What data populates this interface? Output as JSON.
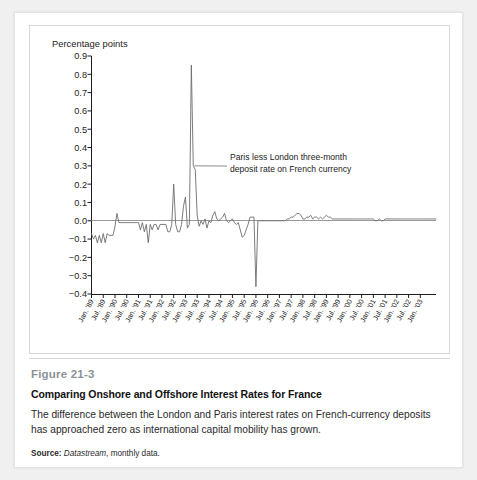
{
  "figure": {
    "number": "Figure 21-3",
    "title": "Comparing Onshore and Offshore Interest Rates for France",
    "description": "The difference between the London and Paris interest rates on French-currency deposits has approached zero as international capital mobility has grown.",
    "source_label": "Source:",
    "source_name": "Datastream",
    "source_rest": ", monthly data."
  },
  "colors": {
    "line": "#6d6d6d",
    "axis": "#1c1c1c",
    "zero_line": "#9a9a9a",
    "figure_number": "#8c9296",
    "page_background": "#f0f0f0",
    "card_background": "#ffffff"
  },
  "chart_data": {
    "type": "line",
    "title": "",
    "xlabel": "",
    "ylabel": "Percentage points",
    "ylim": [
      -0.4,
      0.9
    ],
    "ytick_labels": [
      "0.9",
      "0.8",
      "0.7",
      "0.6",
      "0.5",
      "0.4",
      "0.3",
      "0.2",
      "0.1",
      "0.0",
      "−0.1",
      "−0.2",
      "−0.3",
      "−0.4"
    ],
    "yticks": [
      0.9,
      0.8,
      0.7,
      0.6,
      0.5,
      0.4,
      0.3,
      0.2,
      0.1,
      0.0,
      -0.1,
      -0.2,
      -0.3,
      -0.4
    ],
    "grid": false,
    "legend": "none",
    "zero_reference_line": 0.0,
    "annotations": [
      {
        "name": "series-annotation",
        "line1": "Paris less London three-month",
        "line2": "deposit rate on French currency",
        "points_to_x": "1993-01",
        "points_to_y": 0.3
      }
    ],
    "xtick_labels": [
      "Jan. '89",
      "Jul. '89",
      "Jan. '90",
      "Jul. '90",
      "Jan. '91",
      "Jul. '91",
      "Jan. '92",
      "Jul. '92",
      "Jan. '93",
      "Jul. '93",
      "Jan. '94",
      "Jul. '94",
      "Jan. '95",
      "Jul. '95",
      "Jan. '96",
      "Jul. '96",
      "Jan. '97",
      "Jul. '97",
      "Jan. '98",
      "Jul. '98",
      "Jan. '99",
      "Jul. '99",
      "Jan. '00",
      "Jul. '00",
      "Jan. '01",
      "Jul. '01",
      "Jan. '02",
      "Jul. '02",
      "Jan. '03"
    ],
    "xtick_months": [
      0,
      6,
      12,
      18,
      24,
      30,
      36,
      42,
      48,
      54,
      60,
      66,
      72,
      78,
      84,
      90,
      96,
      102,
      108,
      114,
      120,
      126,
      132,
      138,
      144,
      150,
      156,
      162,
      168
    ],
    "x_start": "1989-01",
    "x_end": "2003-01",
    "series": [
      {
        "name": "Paris less London three-month deposit rate on French currency",
        "values": [
          -0.07,
          -0.1,
          -0.08,
          -0.12,
          -0.08,
          -0.12,
          -0.07,
          -0.12,
          -0.07,
          -0.08,
          -0.08,
          -0.08,
          -0.03,
          0.04,
          -0.01,
          -0.01,
          -0.01,
          -0.01,
          -0.01,
          -0.01,
          -0.01,
          -0.01,
          -0.01,
          -0.01,
          -0.01,
          -0.05,
          -0.01,
          -0.06,
          -0.02,
          -0.12,
          -0.02,
          -0.05,
          -0.02,
          -0.02,
          -0.05,
          -0.02,
          -0.02,
          -0.02,
          -0.02,
          -0.06,
          -0.06,
          -0.02,
          0.2,
          -0.02,
          -0.06,
          -0.06,
          -0.02,
          0.08,
          0.13,
          -0.04,
          -0.02,
          0.85,
          0.3,
          0.28,
          0.03,
          -0.03,
          0.0,
          -0.02,
          0.01,
          -0.04,
          0.0,
          -0.01,
          0.03,
          0.05,
          0.01,
          0.0,
          0.01,
          0.02,
          0.04,
          0.0,
          -0.01,
          0.0,
          0.01,
          -0.01,
          -0.02,
          -0.01,
          -0.05,
          -0.09,
          -0.08,
          -0.05,
          -0.02,
          0.02,
          0.02,
          0.02,
          -0.36,
          0.0,
          0.0,
          0.0,
          0.0,
          0.0,
          0.0,
          0.0,
          0.0,
          0.0,
          0.0,
          0.0,
          0.0,
          0.0,
          0.0,
          0.0,
          0.01,
          0.01,
          0.02,
          0.02,
          0.03,
          0.04,
          0.04,
          0.03,
          0.01,
          0.01,
          0.02,
          0.02,
          0.03,
          0.01,
          0.02,
          0.02,
          0.01,
          0.02,
          0.01,
          0.02,
          0.03,
          0.02,
          0.02,
          0.01,
          0.01,
          0.01,
          0.01,
          0.01,
          0.01,
          0.01,
          0.01,
          0.01,
          0.01,
          0.01,
          0.01,
          0.01,
          0.01,
          0.01,
          0.01,
          0.01,
          0.01,
          0.01,
          0.01,
          0.01,
          0.01,
          0.0,
          0.0,
          0.01,
          0.0,
          0.0,
          0.01,
          0.01,
          0.01,
          0.01,
          0.01,
          0.01,
          0.01,
          0.01,
          0.01,
          0.01,
          0.01,
          0.01,
          0.01,
          0.01,
          0.01,
          0.01,
          0.01,
          0.01,
          0.01,
          0.01,
          0.01,
          0.01,
          0.01,
          0.01,
          0.01,
          0.01,
          0.01
        ]
      }
    ]
  }
}
